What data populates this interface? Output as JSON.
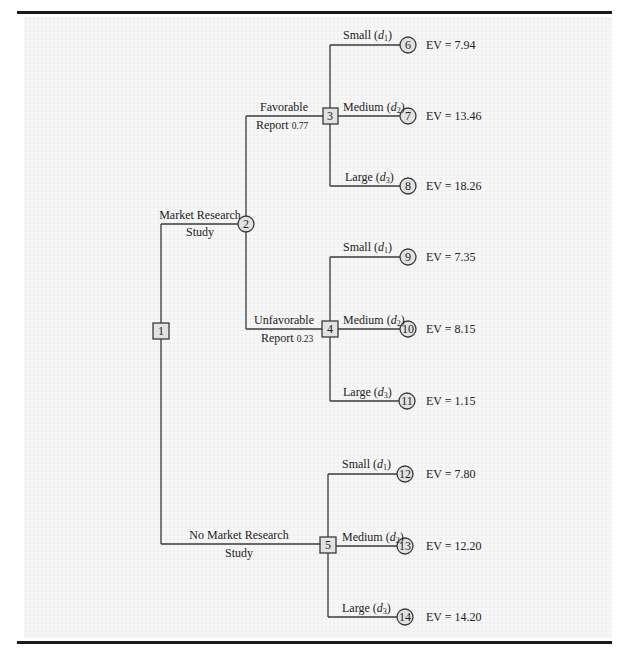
{
  "diagram": {
    "type": "decision_tree",
    "top_text_cropped": true,
    "colors": {
      "node_fill": "#e2e2e2",
      "line": "#3a3a3a",
      "rule": "#1a1a1a",
      "background": "#f6f6f6"
    },
    "nodes": {
      "n1": {
        "id": "1",
        "shape": "square",
        "kind": "decision"
      },
      "n2": {
        "id": "2",
        "shape": "circle",
        "kind": "chance"
      },
      "n3": {
        "id": "3",
        "shape": "square",
        "kind": "decision"
      },
      "n4": {
        "id": "4",
        "shape": "square",
        "kind": "decision"
      },
      "n5": {
        "id": "5",
        "shape": "square",
        "kind": "decision"
      },
      "n6": {
        "id": "6",
        "shape": "circle",
        "ev": "EV = 7.94"
      },
      "n7": {
        "id": "7",
        "shape": "circle",
        "ev": "EV = 13.46"
      },
      "n8": {
        "id": "8",
        "shape": "circle",
        "ev": "EV = 18.26"
      },
      "n9": {
        "id": "9",
        "shape": "circle",
        "ev": "EV = 7.35"
      },
      "n10": {
        "id": "10",
        "shape": "circle",
        "ev": "EV = 8.15"
      },
      "n11": {
        "id": "11",
        "shape": "circle",
        "ev": "EV = 1.15"
      },
      "n12": {
        "id": "12",
        "shape": "circle",
        "ev": "EV = 7.80"
      },
      "n13": {
        "id": "13",
        "shape": "circle",
        "ev": "EV = 12.20"
      },
      "n14": {
        "id": "14",
        "shape": "circle",
        "ev": "EV = 14.20"
      }
    },
    "edges": {
      "market_research": {
        "line1": "Market Research",
        "line2": "Study"
      },
      "no_market_research": {
        "line1": "No Market Research",
        "line2": "Study"
      },
      "favorable": {
        "line1": "Favorable",
        "line2": "Report",
        "prob": "0.77"
      },
      "unfavorable": {
        "line1": "Unfavorable",
        "line2": "Report",
        "prob": "0.23"
      },
      "small": {
        "label": "Small (",
        "var": "d",
        "sub": "1",
        "close": ")"
      },
      "medium": {
        "label": "Medium (",
        "var": "d",
        "sub": "2",
        "close": ")"
      },
      "large": {
        "label": "Large (",
        "var": "d",
        "sub": "3",
        "close": ")"
      }
    }
  }
}
